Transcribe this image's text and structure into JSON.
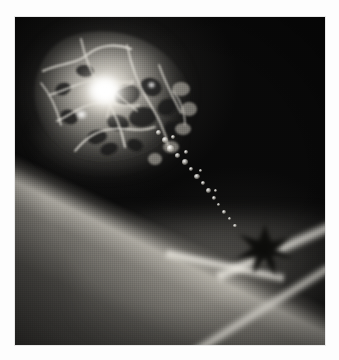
{
  "figure": {
    "border_color": "#fdfdfd",
    "plate_background": "#090909",
    "alt_text": "Grainy monochrome astronomical illustration: a bright reticulated cometary body at upper left trails a chain of glowing fragments down to the right, where a dark star-shaped silhouette sits on a broad diagonal band of light."
  },
  "plate": {
    "x": 15,
    "y": 17,
    "width": 310,
    "height": 328
  },
  "objects": {
    "main_body": {
      "name": "luminous-cellular-body",
      "center_x": 95,
      "center_y": 95,
      "width": 200,
      "height": 175,
      "description": "Irregular rounded mass with bright filamentary web and dark cellular voids"
    },
    "nucleus": {
      "name": "bright-nucleus",
      "center_x": 92,
      "center_y": 76,
      "peak_color": "#ffffff",
      "description": "Intense white core with radiating streaks"
    },
    "tail": {
      "name": "fragment-chain",
      "from_x": 150,
      "from_y": 130,
      "to_x": 235,
      "to_y": 215,
      "knot_count": 18,
      "description": "Chain of small bright knots streaming down-right"
    },
    "dark_star": {
      "name": "dark-star-silhouette",
      "center_x": 250,
      "center_y": 232,
      "width": 100,
      "height": 92,
      "color": "#14130f",
      "description": "Star-shaped dark absorption feature with radiating spikes"
    },
    "glow_band": {
      "name": "diagonal-glow-wedge",
      "angle_deg": 206,
      "bright_edge_color": "#d6d2c8",
      "description": "Broad lit wedge crossing lower right with a sharp bright leading edge"
    },
    "rays": [
      {
        "name": "ray-upper",
        "angle_deg": -24,
        "length": 150
      },
      {
        "name": "ray-left",
        "angle_deg": 12,
        "length": 120
      },
      {
        "name": "ray-lower",
        "angle_deg": -32,
        "length": 210
      }
    ]
  },
  "palette": {
    "white": "#ffffff",
    "highlight": "#ece9e1",
    "midtone": "#8e8b84",
    "shadow": "#2a2a28",
    "black": "#090909"
  }
}
